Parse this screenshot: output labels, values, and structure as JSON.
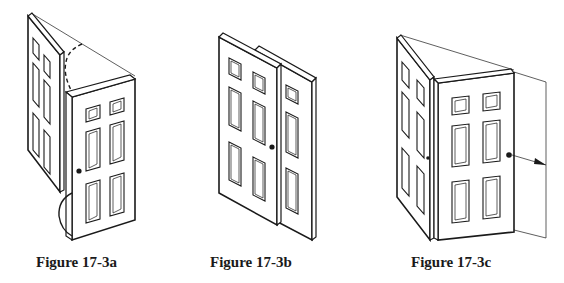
{
  "figures": [
    {
      "id": "a",
      "caption": "Figure 17-3a",
      "description": "Door folding on hinge with swing arc"
    },
    {
      "id": "b",
      "caption": "Figure 17-3b",
      "description": "Two overlapping doors side by side"
    },
    {
      "id": "c",
      "caption": "Figure 17-3c",
      "description": "Door opened with outward swing arrow"
    }
  ],
  "colors": {
    "line": "#1a1a1a",
    "background": "#ffffff"
  }
}
